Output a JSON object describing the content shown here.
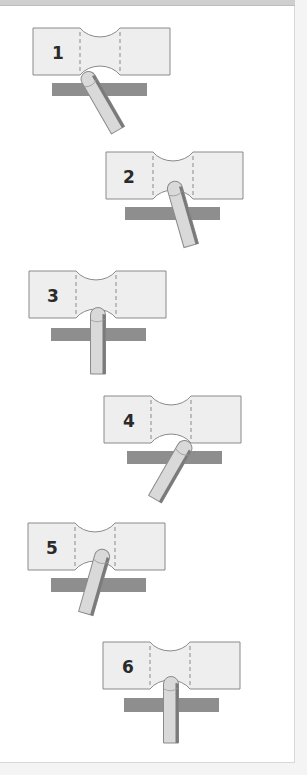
{
  "diagram": {
    "colors": {
      "specimen_fill": "#eeeeee",
      "specimen_stroke": "#8a8a8a",
      "bar_fill": "#8e8e8e",
      "probe_fill": "#d9d9d9",
      "probe_shadow": "#7a7a7a",
      "label": "#2a2a2a",
      "background": "#ffffff"
    },
    "steps": [
      {
        "label": "1",
        "probe": "angled-left-tip"
      },
      {
        "label": "2",
        "probe": "angled-left-tip"
      },
      {
        "label": "3",
        "probe": "vertical"
      },
      {
        "label": "4",
        "probe": "angled-right-tip"
      },
      {
        "label": "5",
        "probe": "angled-right-tip"
      },
      {
        "label": "6",
        "probe": "vertical"
      }
    ]
  }
}
